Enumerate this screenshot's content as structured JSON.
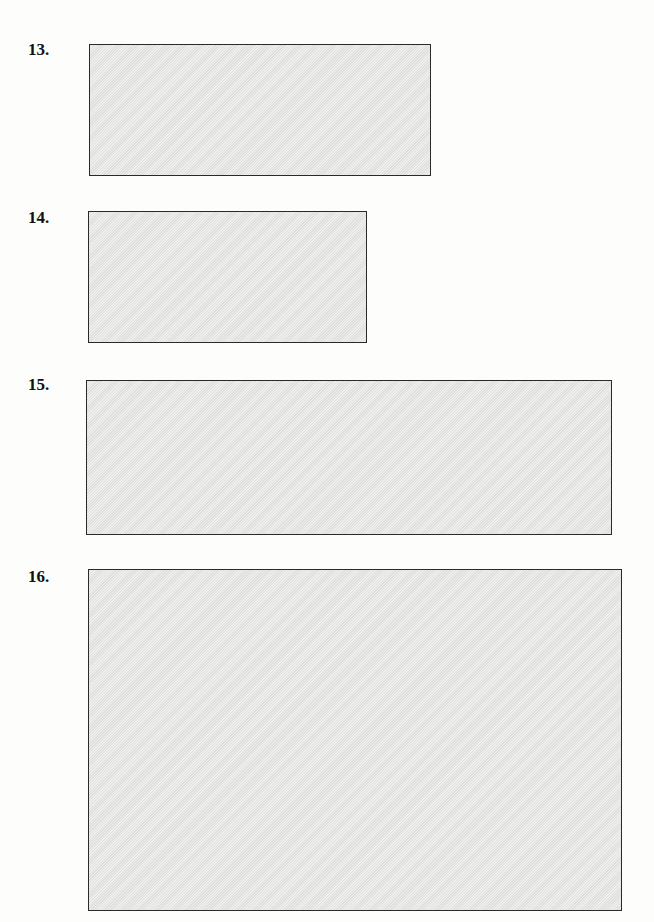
{
  "items": [
    {
      "label": "13.",
      "box": {
        "x": 89,
        "y": 44,
        "w": 342,
        "h": 132
      },
      "label_pos": {
        "x": 28,
        "y": 41
      }
    },
    {
      "label": "14.",
      "box": {
        "x": 88,
        "y": 211,
        "w": 279,
        "h": 132
      },
      "label_pos": {
        "x": 28,
        "y": 209
      }
    },
    {
      "label": "15.",
      "box": {
        "x": 86,
        "y": 380,
        "w": 526,
        "h": 155
      },
      "label_pos": {
        "x": 28,
        "y": 376
      }
    },
    {
      "label": "16.",
      "box": {
        "x": 88,
        "y": 569,
        "w": 534,
        "h": 342
      },
      "label_pos": {
        "x": 28,
        "y": 568
      }
    }
  ],
  "colors": {
    "box_fill": "#e6e6e4",
    "box_border": "#2a2a2a",
    "page": "#fdfdfc"
  }
}
